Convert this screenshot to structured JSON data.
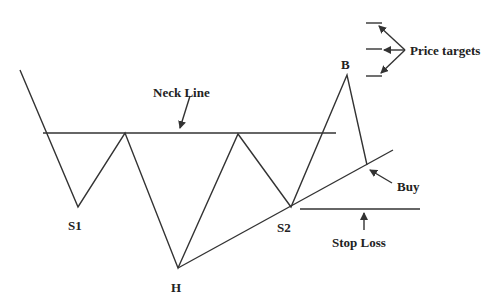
{
  "diagram": {
    "colors": {
      "line": "#333333",
      "text": "#222222",
      "background": "#ffffff"
    },
    "labels": {
      "neck_line": "Neck Line",
      "s1": "S1",
      "h": "H",
      "s2": "S2",
      "b": "B",
      "buy": "Buy",
      "stop_loss": "Stop Loss",
      "price_targets": "Price targets"
    }
  }
}
